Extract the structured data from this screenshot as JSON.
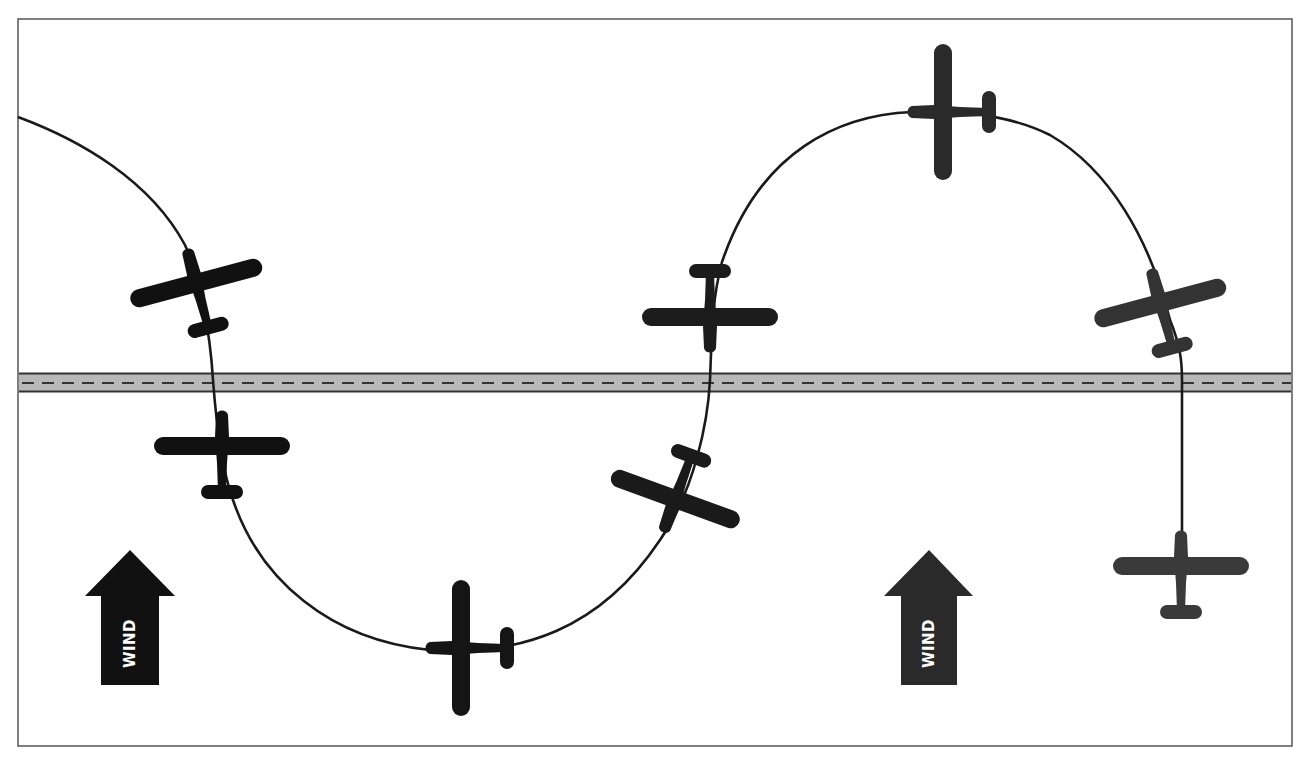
{
  "diagram": {
    "frame": {
      "x": 18,
      "y": 19,
      "width": 1274,
      "height": 727,
      "stroke": "#555555"
    },
    "road": {
      "label": "road",
      "y_top": 373,
      "y_bottom": 392,
      "center_y": 383,
      "fill": "#b8b8b8",
      "edge_color": "#333333",
      "dash_color": "#333333"
    },
    "ground_track": {
      "label": "ground track",
      "color": "#1a1a1a",
      "path": "M18,117 C80,140 150,180 185,245 C200,280 210,330 213,380 C216,420 222,470 233,500 C260,580 330,640 430,650 C520,656 600,630 660,540 C695,490 708,420 710,380 C712,330 712,300 722,262 C760,150 840,115 912,112 C960,110 1010,115 1050,135 C1110,170 1150,240 1170,320 C1180,345 1182,360 1182,380 L1182,535"
    },
    "wind_arrows": [
      {
        "label": "WIND",
        "tip_x": 130,
        "tip_y": 550,
        "head_left": 85,
        "head_right": 175,
        "head_base_y": 596,
        "shaft_left": 101,
        "shaft_right": 159,
        "bottom_y": 685,
        "color": "#111111"
      },
      {
        "label": "WIND",
        "tip_x": 929,
        "tip_y": 550,
        "head_left": 884,
        "head_right": 973,
        "head_base_y": 596,
        "shaft_left": 901,
        "shaft_right": 957,
        "bottom_y": 685,
        "color": "#2a2a2a"
      }
    ],
    "airplanes": [
      {
        "id": "plane-1",
        "x": 196,
        "y": 282,
        "heading_deg": -15,
        "color": "#111111"
      },
      {
        "id": "plane-2",
        "x": 222,
        "y": 445,
        "heading_deg": 0,
        "color": "#111111"
      },
      {
        "id": "plane-3",
        "x": 460,
        "y": 648,
        "heading_deg": -90,
        "color": "#151515"
      },
      {
        "id": "plane-4",
        "x": 675,
        "y": 500,
        "heading_deg": 200,
        "color": "#1a1a1a"
      },
      {
        "id": "plane-5",
        "x": 710,
        "y": 318,
        "heading_deg": 180,
        "color": "#1c1c1c"
      },
      {
        "id": "plane-6",
        "x": 942,
        "y": 112,
        "heading_deg": -90,
        "color": "#2a2a2a"
      },
      {
        "id": "plane-7",
        "x": 1160,
        "y": 302,
        "heading_deg": -15,
        "color": "#333333"
      },
      {
        "id": "plane-8",
        "x": 1181,
        "y": 565,
        "heading_deg": 0,
        "color": "#3a3a3a"
      }
    ]
  }
}
